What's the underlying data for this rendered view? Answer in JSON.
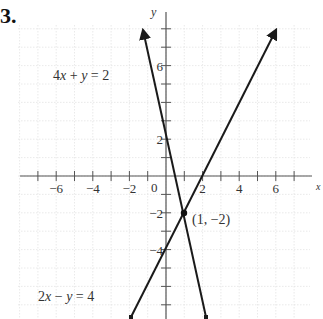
{
  "problem_number": "3.",
  "chart_data": {
    "type": "line",
    "title": "",
    "xlabel": "x",
    "ylabel": "y",
    "xlim": [
      -8,
      8.5
    ],
    "ylim": [
      -7.8,
      9.5
    ],
    "grid": true,
    "x_ticks": [
      -6,
      -4,
      -2,
      2,
      4,
      6
    ],
    "y_ticks": [
      6,
      2,
      -2,
      -4
    ],
    "origin_label": "0",
    "series": [
      {
        "name": "4x + y = 2",
        "equation": "y = 2 - 4x",
        "x": [
          -1.26,
          2.2
        ],
        "y": [
          7.04,
          -6.8
        ],
        "label_pos": [
          -4.3,
          6.6
        ]
      },
      {
        "name": "2x - y = 4",
        "equation": "y = 2x - 4",
        "x": [
          -1.9,
          6.0
        ],
        "y": [
          -7.8,
          8.0
        ],
        "label_pos": [
          -6.5,
          -6.3
        ]
      }
    ],
    "annotations": [
      {
        "text": "(1, -2)",
        "x": 1,
        "y": -2,
        "type": "intersection-point"
      }
    ]
  },
  "labels": {
    "eq1": "4x + y = 2",
    "eq2": "2x − y = 4",
    "point": "(1, −2)",
    "origin": "0",
    "y_axis": "y",
    "x_axis": "x",
    "xt": [
      "−6",
      "−4",
      "−2",
      "2",
      "4",
      "6"
    ],
    "yt": [
      "6",
      "2",
      "−2",
      "−4"
    ]
  }
}
